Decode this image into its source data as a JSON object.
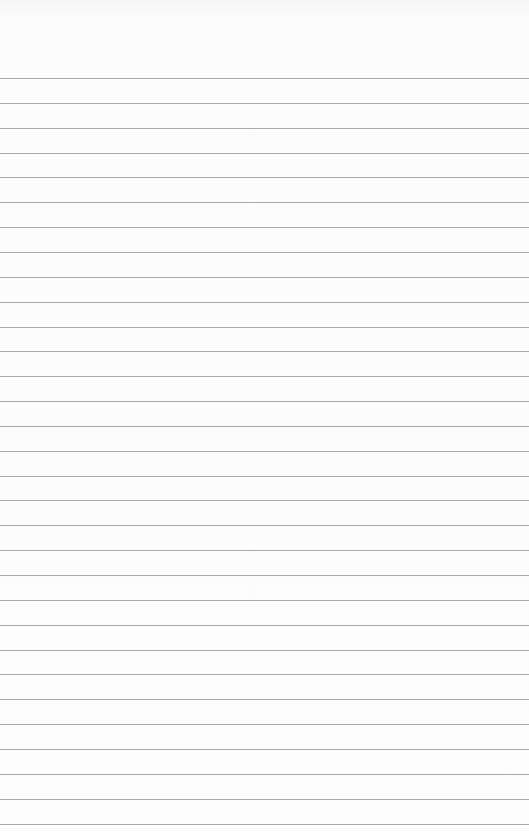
{
  "paper": {
    "type": "lined-paper",
    "background_color": "#fcfcfc",
    "line_color": "#9a9a9a",
    "first_line_y": 78,
    "line_spacing": 24.85,
    "line_count": 31
  }
}
